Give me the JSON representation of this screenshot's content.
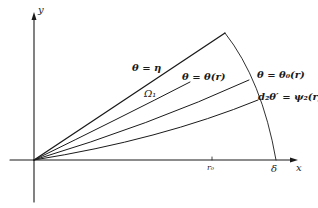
{
  "diagram": {
    "axes": {
      "x_label": "x",
      "y_label": "y"
    },
    "ticks": {
      "r0": "r₀",
      "delta": "δ"
    },
    "curve_labels": {
      "eta": "θ = η",
      "theta_r": "θ = θ(r)",
      "theta0_r": "θ = θ₀(r)",
      "psi2": "d₂θ′ = ψ₂(r)"
    },
    "region_label": "Ω₁",
    "colors": {
      "stroke": "#1a1a1a",
      "background": "#ffffff"
    }
  }
}
